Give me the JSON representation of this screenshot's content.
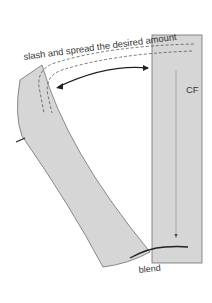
{
  "diagram": {
    "labels": {
      "instruction": "slash and spread the desired amount",
      "center_front": "CF",
      "blend": "blend"
    },
    "colors": {
      "piece_fill": "#d6d6d6",
      "piece_stroke": "#6e6e6e",
      "dash": "#555555",
      "arrow": "#222222",
      "text": "#333333",
      "background": "#ffffff"
    }
  }
}
